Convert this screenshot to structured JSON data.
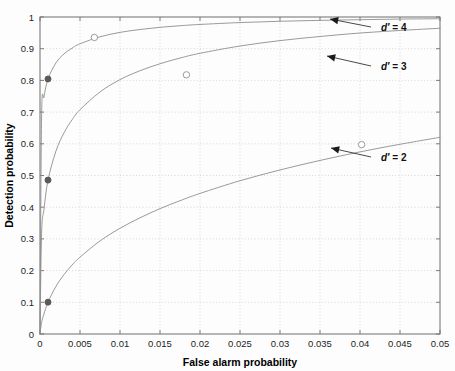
{
  "figure": {
    "background_color": "#fdfdfd",
    "plot_area": {
      "x": 40,
      "y": 17,
      "width": 400,
      "height": 317
    }
  },
  "chart_data": {
    "type": "line",
    "title": "",
    "subtitle": "",
    "xlabel": "False alarm probability",
    "ylabel": "Detection probability",
    "xlim": [
      0,
      0.05
    ],
    "ylim": [
      0,
      1
    ],
    "grid": true,
    "grid_style": "dotted",
    "legend_position": "none",
    "xticks": [
      0,
      0.005,
      0.01,
      0.015,
      0.02,
      0.025,
      0.03,
      0.035,
      0.04,
      0.045,
      0.05
    ],
    "xtick_labels": [
      "0",
      "0.005",
      "0.01",
      "0.015",
      "0.02",
      "0.025",
      "0.03",
      "0.035",
      "0.04",
      "0.045",
      "0.05"
    ],
    "yticks": [
      0,
      0.1,
      0.2,
      0.3,
      0.4,
      0.5,
      0.6,
      0.7,
      0.8,
      0.9,
      1
    ],
    "ytick_labels": [
      "0",
      "0.1",
      "0.2",
      "0.3",
      "0.4",
      "0.5",
      "0.6",
      "0.7",
      "0.8",
      "0.9",
      "1"
    ],
    "line_color": "#8e8e8e",
    "marker_filled_color": "#5a5a5a",
    "marker_open_color": "#9a9a9a",
    "series": [
      {
        "name": "d' = 2",
        "d_prime": 2,
        "x": [
          0.0,
          0.0002,
          0.0005,
          0.001,
          0.002,
          0.003,
          0.004,
          0.005,
          0.0075,
          0.01,
          0.0125,
          0.015,
          0.0175,
          0.02,
          0.025,
          0.03,
          0.035,
          0.04,
          0.045,
          0.05
        ],
        "y": [
          0.0,
          0.0365,
          0.0635,
          0.1005,
          0.1505,
          0.1875,
          0.2175,
          0.2425,
          0.2935,
          0.3335,
          0.3665,
          0.3955,
          0.4205,
          0.4435,
          0.4835,
          0.5175,
          0.5475,
          0.5745,
          0.5985,
          0.6205
        ]
      },
      {
        "name": "d' = 3",
        "d_prime": 3,
        "x": [
          0.0,
          0.0002,
          0.0005,
          0.001,
          0.002,
          0.003,
          0.004,
          0.005,
          0.0075,
          0.01,
          0.0125,
          0.015,
          0.0175,
          0.02,
          0.025,
          0.03,
          0.035,
          0.04,
          0.045,
          0.05
        ],
        "y": [
          0.0,
          0.3175,
          0.3935,
          0.4855,
          0.5775,
          0.6345,
          0.6755,
          0.7075,
          0.7635,
          0.8025,
          0.8305,
          0.8525,
          0.8705,
          0.8855,
          0.9085,
          0.9255,
          0.9385,
          0.9495,
          0.9575,
          0.9645
        ]
      },
      {
        "name": "d' = 4",
        "d_prime": 4,
        "x": [
          0.0,
          0.0002,
          0.0005,
          0.001,
          0.002,
          0.003,
          0.004,
          0.005,
          0.0075,
          0.01,
          0.0125,
          0.015,
          0.0175,
          0.02,
          0.025,
          0.03,
          0.035,
          0.04,
          0.045,
          0.05
        ],
        "y": [
          0.0,
          0.6875,
          0.7475,
          0.8045,
          0.8555,
          0.8835,
          0.9015,
          0.9155,
          0.9375,
          0.9515,
          0.9605,
          0.9675,
          0.9725,
          0.9765,
          0.9825,
          0.9865,
          0.9895,
          0.9915,
          0.9935,
          0.9945
        ]
      }
    ],
    "markers_filled": [
      {
        "x": 0.001,
        "y": 0.1005,
        "series": "d' = 2"
      },
      {
        "x": 0.001,
        "y": 0.4855,
        "series": "d' = 3"
      },
      {
        "x": 0.001,
        "y": 0.8045,
        "series": "d' = 4"
      }
    ],
    "markers_open": [
      {
        "x": 0.0068,
        "y": 0.9355,
        "series": "d' = 4"
      },
      {
        "x": 0.0183,
        "y": 0.8175,
        "series": "d' = 3"
      },
      {
        "x": 0.0402,
        "y": 0.5975,
        "series": "d' = 2"
      }
    ],
    "annotations": [
      {
        "label_prefix": "d",
        "label_prime": "′",
        "label_suffix": " = 4",
        "text": "d′ = 4",
        "text_x": 381,
        "text_y": 31,
        "arrow_tail_x": 371,
        "arrow_tail_y": 27,
        "arrow_head_x": 330,
        "arrow_head_y": 19
      },
      {
        "label_prefix": "d",
        "label_prime": "′",
        "label_suffix": " = 3",
        "text": "d′ = 3",
        "text_x": 381,
        "text_y": 70,
        "arrow_tail_x": 371,
        "arrow_tail_y": 66,
        "arrow_head_x": 327,
        "arrow_head_y": 56
      },
      {
        "label_prefix": "d",
        "label_prime": "′",
        "label_suffix": " = 2",
        "text": "d′ = 2",
        "text_x": 381,
        "text_y": 161,
        "arrow_tail_x": 371,
        "arrow_tail_y": 157,
        "arrow_head_x": 331,
        "arrow_head_y": 148
      }
    ]
  }
}
